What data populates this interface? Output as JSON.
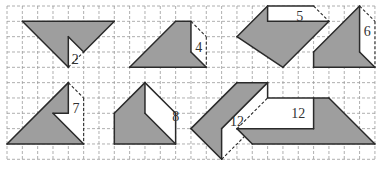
{
  "grid": {
    "x0": 7,
    "y0": 6,
    "cell": 15.33,
    "cols": 24,
    "rows": 10,
    "line_color": "#9a9a9a"
  },
  "colors": {
    "fill": "#9e9e9e",
    "stroke": "#2a2a2a",
    "white": "#ffffff",
    "text": "#333333"
  },
  "figures": [
    {
      "id": "fig-1",
      "label": "2",
      "label_pos": [
        4.45,
        3.45
      ],
      "gray": [
        [
          1,
          1
        ],
        [
          7,
          1
        ],
        [
          5,
          3
        ],
        [
          4,
          2
        ],
        [
          4,
          4
        ]
      ],
      "white": [
        [
          4,
          2
        ],
        [
          5,
          3
        ],
        [
          4,
          4
        ]
      ],
      "solid": [
        [
          [
            1,
            1
          ],
          [
            7,
            1
          ]
        ],
        [
          [
            7,
            1
          ],
          [
            5,
            3
          ]
        ],
        [
          [
            5,
            3
          ],
          [
            4,
            2
          ]
        ],
        [
          [
            4,
            2
          ],
          [
            4,
            4
          ]
        ],
        [
          [
            4,
            4
          ],
          [
            1,
            1
          ]
        ]
      ],
      "dashed": [
        [
          [
            4,
            4
          ],
          [
            5,
            3
          ]
        ]
      ]
    },
    {
      "id": "fig-2",
      "label": "4",
      "label_pos": [
        12.5,
        2.65
      ],
      "gray": [
        [
          8,
          4
        ],
        [
          11,
          1
        ],
        [
          12,
          1
        ],
        [
          12,
          3
        ],
        [
          13,
          4
        ]
      ],
      "white": [
        [
          12,
          1
        ],
        [
          13,
          2
        ],
        [
          13,
          4
        ],
        [
          12,
          3
        ]
      ],
      "solid": [
        [
          [
            8,
            4
          ],
          [
            11,
            1
          ]
        ],
        [
          [
            11,
            1
          ],
          [
            12,
            1
          ]
        ],
        [
          [
            12,
            1
          ],
          [
            12,
            3
          ]
        ],
        [
          [
            12,
            3
          ],
          [
            13,
            4
          ]
        ],
        [
          [
            13,
            4
          ],
          [
            8,
            4
          ]
        ]
      ],
      "dashed": [
        [
          [
            12,
            1
          ],
          [
            13,
            2
          ]
        ],
        [
          [
            13,
            2
          ],
          [
            13,
            4
          ]
        ]
      ]
    },
    {
      "id": "fig-3",
      "label": "5",
      "label_pos": [
        19.1,
        0.65
      ],
      "gray": [
        [
          15,
          2
        ],
        [
          17,
          0
        ],
        [
          17,
          1
        ],
        [
          21,
          1
        ],
        [
          18,
          4
        ]
      ],
      "white": [
        [
          17,
          0
        ],
        [
          20,
          0
        ],
        [
          21,
          1
        ],
        [
          17,
          1
        ]
      ],
      "solid": [
        [
          [
            15,
            2
          ],
          [
            17,
            0
          ]
        ],
        [
          [
            17,
            0
          ],
          [
            20,
            0
          ]
        ],
        [
          [
            17,
            0
          ],
          [
            17,
            1
          ]
        ],
        [
          [
            17,
            1
          ],
          [
            21,
            1
          ]
        ],
        [
          [
            21,
            1
          ],
          [
            18,
            4
          ]
        ],
        [
          [
            18,
            4
          ],
          [
            15,
            2
          ]
        ]
      ],
      "dashed": [
        [
          [
            20,
            0
          ],
          [
            21,
            1
          ]
        ]
      ]
    },
    {
      "id": "fig-4",
      "label": "6",
      "label_pos": [
        23.5,
        1.65
      ],
      "gray": [
        [
          20,
          3
        ],
        [
          23,
          0
        ],
        [
          23,
          3
        ],
        [
          24,
          4
        ],
        [
          20,
          4
        ]
      ],
      "white": [
        [
          23,
          0
        ],
        [
          24,
          1
        ],
        [
          24,
          4
        ],
        [
          23,
          3
        ]
      ],
      "solid": [
        [
          [
            20,
            3
          ],
          [
            23,
            0
          ]
        ],
        [
          [
            23,
            0
          ],
          [
            23,
            3
          ]
        ],
        [
          [
            23,
            3
          ],
          [
            24,
            4
          ]
        ],
        [
          [
            24,
            4
          ],
          [
            20,
            4
          ]
        ],
        [
          [
            20,
            4
          ],
          [
            20,
            3
          ]
        ]
      ],
      "dashed": [
        [
          [
            23,
            0
          ],
          [
            24,
            1
          ]
        ],
        [
          [
            24,
            1
          ],
          [
            24,
            4
          ]
        ]
      ]
    },
    {
      "id": "fig-5",
      "label": "7",
      "label_pos": [
        4.5,
        6.65
      ],
      "gray": [
        [
          0,
          9
        ],
        [
          4,
          5
        ],
        [
          4,
          7
        ],
        [
          3,
          7
        ],
        [
          5,
          9
        ]
      ],
      "white": [
        [
          4,
          5
        ],
        [
          5,
          6
        ],
        [
          5,
          9
        ],
        [
          3,
          7
        ],
        [
          4,
          7
        ]
      ],
      "solid": [
        [
          [
            0,
            9
          ],
          [
            4,
            5
          ]
        ],
        [
          [
            4,
            5
          ],
          [
            4,
            7
          ]
        ],
        [
          [
            4,
            7
          ],
          [
            3,
            7
          ]
        ],
        [
          [
            3,
            7
          ],
          [
            5,
            9
          ]
        ],
        [
          [
            5,
            9
          ],
          [
            0,
            9
          ]
        ]
      ],
      "dashed": [
        [
          [
            4,
            5
          ],
          [
            5,
            6
          ]
        ],
        [
          [
            5,
            6
          ],
          [
            5,
            9
          ]
        ]
      ]
    },
    {
      "id": "fig-6",
      "label": "8",
      "label_pos": [
        11,
        7.15
      ],
      "gray": [
        [
          7,
          7
        ],
        [
          9,
          5
        ],
        [
          9,
          7
        ],
        [
          11,
          9
        ],
        [
          7,
          9
        ]
      ],
      "white": [
        [
          9,
          5
        ],
        [
          11,
          7
        ],
        [
          11,
          9
        ],
        [
          9,
          7
        ]
      ],
      "solid": [
        [
          [
            7,
            7
          ],
          [
            9,
            5
          ]
        ],
        [
          [
            9,
            5
          ],
          [
            11,
            7
          ]
        ],
        [
          [
            11,
            7
          ],
          [
            11,
            9
          ]
        ],
        [
          [
            9,
            5
          ],
          [
            9,
            7
          ]
        ],
        [
          [
            9,
            7
          ],
          [
            11,
            9
          ]
        ],
        [
          [
            11,
            9
          ],
          [
            7,
            9
          ]
        ],
        [
          [
            7,
            9
          ],
          [
            7,
            7
          ]
        ]
      ],
      "dashed": []
    },
    {
      "id": "fig-7",
      "label": "12",
      "label_pos": [
        15.0,
        7.5
      ],
      "gray": [
        [
          12,
          8
        ],
        [
          15,
          5
        ],
        [
          17,
          5
        ],
        [
          14,
          8
        ],
        [
          14,
          10
        ]
      ],
      "white": [
        [
          14,
          8
        ],
        [
          17,
          5
        ],
        [
          17,
          7
        ],
        [
          14,
          10
        ]
      ],
      "solid": [
        [
          [
            12,
            8
          ],
          [
            15,
            5
          ]
        ],
        [
          [
            15,
            5
          ],
          [
            17,
            5
          ]
        ],
        [
          [
            17,
            5
          ],
          [
            14,
            8
          ]
        ],
        [
          [
            14,
            8
          ],
          [
            14,
            10
          ]
        ],
        [
          [
            14,
            10
          ],
          [
            12,
            8
          ]
        ],
        [
          [
            17,
            5
          ],
          [
            17,
            7
          ]
        ]
      ],
      "dashed": [
        [
          [
            14,
            10
          ],
          [
            17,
            7
          ]
        ]
      ]
    },
    {
      "id": "fig-8",
      "label": "12",
      "label_pos": [
        19.0,
        6.95
      ],
      "gray": [
        [
          15,
          8
        ],
        [
          20,
          8
        ],
        [
          20,
          6
        ],
        [
          21,
          6
        ],
        [
          24,
          9
        ],
        [
          16,
          9
        ]
      ],
      "white": [
        [
          15,
          8
        ],
        [
          17,
          6
        ],
        [
          20,
          6
        ],
        [
          20,
          8
        ]
      ],
      "solid": [
        [
          [
            17,
            6
          ],
          [
            21,
            6
          ]
        ],
        [
          [
            20,
            6
          ],
          [
            20,
            8
          ]
        ],
        [
          [
            20,
            8
          ],
          [
            15,
            8
          ]
        ],
        [
          [
            15,
            8
          ],
          [
            16,
            9
          ]
        ],
        [
          [
            16,
            9
          ],
          [
            24,
            9
          ]
        ],
        [
          [
            24,
            9
          ],
          [
            21,
            6
          ]
        ]
      ],
      "dashed": [
        [
          [
            15,
            8
          ],
          [
            17,
            6
          ]
        ]
      ]
    }
  ]
}
